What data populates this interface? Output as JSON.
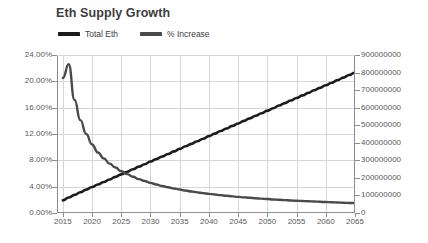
{
  "chart_data": {
    "type": "line",
    "title": "Eth Supply Growth",
    "xlabel": "",
    "ylabel": "",
    "grid": true,
    "legend_position": "top-left",
    "x": [
      2015,
      2016,
      2017,
      2018,
      2019,
      2020,
      2021,
      2022,
      2023,
      2024,
      2025,
      2026,
      2027,
      2028,
      2029,
      2030,
      2031,
      2032,
      2033,
      2034,
      2035,
      2036,
      2037,
      2038,
      2039,
      2040,
      2041,
      2042,
      2043,
      2044,
      2045,
      2046,
      2047,
      2048,
      2049,
      2050,
      2051,
      2052,
      2053,
      2054,
      2055,
      2056,
      2057,
      2058,
      2059,
      2060,
      2061,
      2062,
      2063,
      2064,
      2065
    ],
    "xlim": [
      2014,
      2065
    ],
    "xticks": [
      2015,
      2020,
      2025,
      2030,
      2035,
      2040,
      2045,
      2050,
      2055,
      2060,
      2065
    ],
    "xticklabels": [
      "2015",
      "2020",
      "2025",
      "2030",
      "2035",
      "2040",
      "2045",
      "2050",
      "2055",
      "2060",
      "2065"
    ],
    "axes": [
      {
        "id": "left",
        "name": "% Increase axis",
        "ylim": [
          0,
          24
        ],
        "yticks": [
          0,
          4,
          8,
          12,
          16,
          20,
          24
        ],
        "yticklabels": [
          "0.00%",
          "4.00%",
          "8.00%",
          "12.00%",
          "16.00%",
          "20.00%",
          "24.00%"
        ]
      },
      {
        "id": "right",
        "name": "Total Eth axis",
        "ylim": [
          0,
          900000000
        ],
        "yticks": [
          0,
          100000000,
          200000000,
          300000000,
          400000000,
          500000000,
          600000000,
          700000000,
          800000000,
          900000000
        ],
        "yticklabels": [
          "0",
          "100000000",
          "200000000",
          "300000000",
          "400000000",
          "500000000",
          "600000000",
          "700000000",
          "800000000",
          "900000000"
        ]
      }
    ],
    "series": [
      {
        "name": "Total Eth",
        "axis": "right",
        "color": "#1c1c1c",
        "width": 2.6,
        "values": [
          72000000,
          88000000,
          103000000,
          118000000,
          133000000,
          148000000,
          162000000,
          177000000,
          191000000,
          206000000,
          220000000,
          235000000,
          249000000,
          264000000,
          278000000,
          293000000,
          307000000,
          322000000,
          336000000,
          351000000,
          365000000,
          380000000,
          394000000,
          409000000,
          423000000,
          438000000,
          452000000,
          467000000,
          481000000,
          496000000,
          510000000,
          525000000,
          539000000,
          554000000,
          568000000,
          583000000,
          597000000,
          612000000,
          626000000,
          641000000,
          655000000,
          670000000,
          684000000,
          699000000,
          713000000,
          728000000,
          742000000,
          757000000,
          771000000,
          786000000,
          800000000
        ]
      },
      {
        "name": "% Increase",
        "axis": "left",
        "color": "#4a4a4a",
        "width": 2.4,
        "values": [
          20.5,
          22.6,
          17.2,
          14.1,
          12.0,
          10.4,
          9.2,
          8.3,
          7.5,
          6.9,
          6.35,
          5.9,
          5.5,
          5.15,
          4.85,
          4.58,
          4.33,
          4.11,
          3.91,
          3.73,
          3.56,
          3.41,
          3.27,
          3.14,
          3.02,
          2.91,
          2.8,
          2.71,
          2.62,
          2.53,
          2.45,
          2.38,
          2.31,
          2.24,
          2.18,
          2.12,
          2.06,
          2.01,
          1.96,
          1.91,
          1.86,
          1.82,
          1.78,
          1.74,
          1.7,
          1.66,
          1.63,
          1.59,
          1.56,
          1.53,
          1.5
        ]
      }
    ],
    "colors": {
      "total_eth": "#1c1c1c",
      "percent_increase": "#4a4a4a",
      "grid": "#d6d6d6",
      "axis": "#8c8c8c",
      "text": "#5a5a5a",
      "title": "#3d3d3d",
      "background": "#ffffff"
    }
  }
}
